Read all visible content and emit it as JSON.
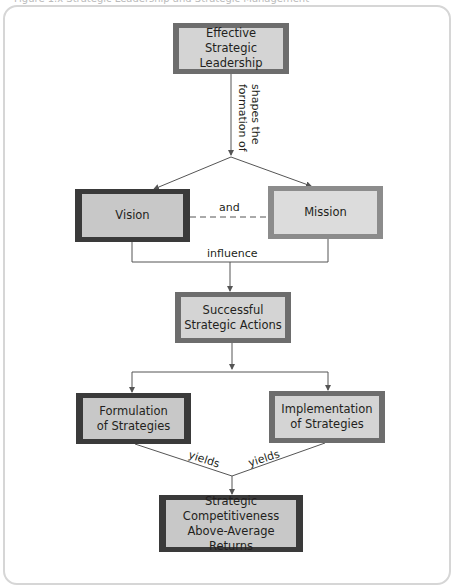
{
  "caption": "Figure 1.x  Strategic Leadership and Strategic Management",
  "nodes": {
    "leadership": "Effective Strategic\nLeadership",
    "vision": "Vision",
    "mission": "Mission",
    "actions": "Successful\nStrategic Actions",
    "formulation": "Formulation\nof Strategies",
    "implementation": "Implementation\nof Strategies",
    "outcome": "Strategic\nCompetitiveness\nAbove-Average Returns"
  },
  "edge_labels": {
    "shapes": "shapes the\nformation of",
    "and": "and",
    "influence": "influence",
    "yields_left": "yields",
    "yields_right": "yields"
  },
  "colors": {
    "box_fill": "#d9d9d9",
    "border_dark": "#3a3a3a",
    "border_mid": "#6d6d6d",
    "line": "#555555",
    "frame": "#d6d6d6"
  }
}
